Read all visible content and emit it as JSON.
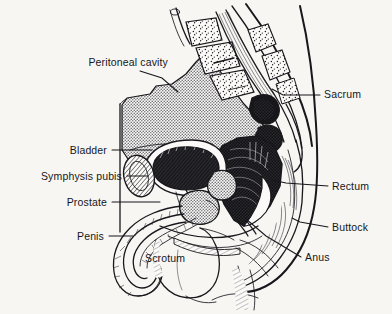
{
  "figure": {
    "background_color": "#f7f6f3",
    "ink_color": "#18181c",
    "label_color": "#16161a",
    "stipple_gray": "#8d8d8d"
  },
  "labels": {
    "peritoneal_cavity": "Peritoneal cavity",
    "sacrum": "Sacrum",
    "bladder": "Bladder",
    "symphysis_pubis": "Symphysis pubis",
    "prostate": "Prostate",
    "rectum": "Rectum",
    "buttock": "Buttock",
    "penis": "Penis",
    "scrotum": "Scrotum",
    "anus": "Anus"
  },
  "label_positions": [
    {
      "key": "peritoneal_cavity",
      "x": 168,
      "y": 66,
      "anchor": "end"
    },
    {
      "key": "sacrum",
      "x": 324,
      "y": 98,
      "anchor": "start"
    },
    {
      "key": "bladder",
      "x": 107,
      "y": 154,
      "anchor": "end"
    },
    {
      "key": "symphysis_pubis",
      "x": 122,
      "y": 180,
      "anchor": "end"
    },
    {
      "key": "prostate",
      "x": 107,
      "y": 206,
      "anchor": "end"
    },
    {
      "key": "rectum",
      "x": 332,
      "y": 190,
      "anchor": "start"
    },
    {
      "key": "buttock",
      "x": 332,
      "y": 231,
      "anchor": "start"
    },
    {
      "key": "penis",
      "x": 104,
      "y": 240,
      "anchor": "end"
    },
    {
      "key": "scrotum",
      "x": 145,
      "y": 262,
      "anchor": "start"
    },
    {
      "key": "anus",
      "x": 305,
      "y": 261,
      "anchor": "start"
    }
  ],
  "leader_lines": [
    {
      "key": "peritoneal_cavity",
      "points": "140,71 162,78 178,92"
    },
    {
      "key": "sacrum",
      "points": "320,95 283,95 272,89"
    },
    {
      "key": "bladder",
      "points": "112,150 152,150"
    },
    {
      "key": "symphysis_pubis",
      "points": "127,176 148,176"
    },
    {
      "key": "prostate",
      "points": "112,202 160,202"
    },
    {
      "key": "rectum",
      "points": "328,186 286,183 272,180"
    },
    {
      "key": "buttock",
      "points": "328,227 300,222 292,218"
    },
    {
      "key": "penis",
      "points": "109,236 133,236"
    },
    {
      "key": "anus",
      "points": "301,257 266,236 246,219"
    }
  ]
}
